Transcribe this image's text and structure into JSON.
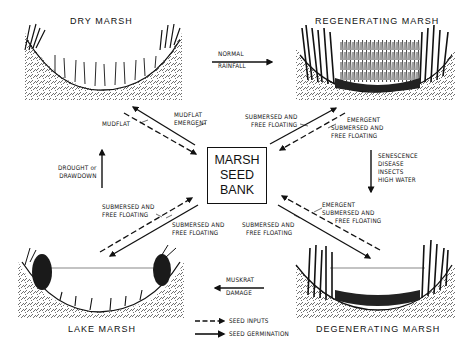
{
  "diagram": {
    "center": {
      "lines": [
        "MARSH",
        "SEED",
        "BANK"
      ]
    },
    "stages": {
      "dry": "DRY MARSH",
      "regenerating": "REGENERATING MARSH",
      "lake": "LAKE MARSH",
      "degenerating": "DEGENERATING MARSH"
    },
    "transitions": {
      "dry_to_regen": [
        "NORMAL",
        "RAINFALL"
      ],
      "regen_to_degen": [
        "SENESCENCE",
        "DISEASE",
        "INSECTS",
        "HIGH WATER"
      ],
      "degen_to_lake": [
        "MUSKRAT",
        "DAMAGE"
      ],
      "lake_to_dry": [
        "DROUGHT or",
        "DRAWDOWN"
      ]
    },
    "flows": {
      "dry_input": "MUDFLAT",
      "dry_germ": [
        "MUDFLAT",
        "EMERGENT"
      ],
      "regen_germ": [
        "SUBMERSED AND",
        "FREE FLOATING"
      ],
      "regen_input": [
        "EMERGENT",
        "SUBMERSED AND",
        "FREE FLOATING"
      ],
      "lake_input": [
        "SUBMERSED AND",
        "FREE FLOATING"
      ],
      "lake_germ": [
        "SUBMERSED AND",
        "FREE FLOATING"
      ],
      "degen_germ": [
        "SUBMERSED AND",
        "FREE FLOATING"
      ],
      "degen_input": [
        "EMERGENT",
        "SUBMERSED AND",
        "FREE FLOATING"
      ]
    },
    "legend": {
      "dashed": "SEED INPUTS",
      "solid": "SEED GERMINATION"
    }
  }
}
